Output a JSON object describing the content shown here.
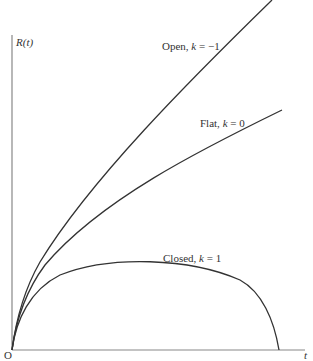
{
  "diagram": {
    "y_axis_label": "R(t)",
    "x_axis_label": "t",
    "origin_label": "O",
    "curves": [
      {
        "name": "open",
        "label_prefix": "Open, ",
        "k_symbol": "k",
        "eq": " = ",
        "k_value": "−1"
      },
      {
        "name": "flat",
        "label_prefix": "Flat, ",
        "k_symbol": "k",
        "eq": " = ",
        "k_value": "0"
      },
      {
        "name": "closed",
        "label_prefix": "Closed, ",
        "k_symbol": "k",
        "eq": " = ",
        "k_value": "1"
      }
    ]
  }
}
